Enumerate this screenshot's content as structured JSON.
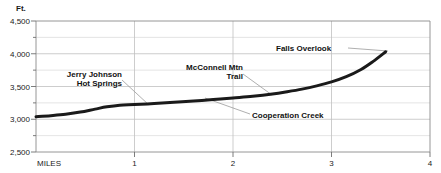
{
  "chart_data": {
    "type": "line",
    "title": "",
    "subtitle": "",
    "xlabel": "MILES",
    "ylabel": "Ft.",
    "xlim": [
      0,
      4
    ],
    "ylim": [
      2500,
      4500
    ],
    "grid": true,
    "legend_position": "none",
    "x_ticks": [
      "1",
      "2",
      "3",
      "4"
    ],
    "x_tick_values": [
      1,
      2,
      3,
      4
    ],
    "x_origin_label": "MILES",
    "y_ticks": [
      "2,500",
      "3,000",
      "3,500",
      "4,000",
      "4,500"
    ],
    "y_tick_values": [
      2500,
      3000,
      3500,
      4000,
      4500
    ],
    "y_minor_step": 250,
    "series": [
      {
        "name": "Trail elevation profile",
        "x": [
          0.0,
          0.15,
          0.3,
          0.45,
          0.6,
          0.72,
          0.85,
          1.0,
          1.2,
          1.4,
          1.6,
          1.8,
          2.0,
          2.2,
          2.4,
          2.55,
          2.7,
          2.85,
          3.0,
          3.15,
          3.3,
          3.42,
          3.55
        ],
        "y": [
          3040,
          3055,
          3075,
          3110,
          3155,
          3190,
          3215,
          3225,
          3240,
          3258,
          3278,
          3300,
          3325,
          3350,
          3385,
          3420,
          3460,
          3510,
          3570,
          3650,
          3760,
          3880,
          4030
        ]
      }
    ],
    "annotations": [
      {
        "label": "Jerry Johnson\nHot Springs",
        "line1": "Jerry Johnson",
        "line2": "Hot Springs",
        "align": "right",
        "point_miles": 1.15,
        "point_feet": 3235
      },
      {
        "label": "McConnell Mtn\nTrail",
        "line1": "McConnell Mtn",
        "line2": "Trail",
        "align": "right",
        "point_miles": 2.42,
        "point_feet": 3425
      },
      {
        "label": "Cooperation Creek",
        "line1": "Cooperation Creek",
        "line2": "",
        "align": "left",
        "point_miles": 1.72,
        "point_feet": 3292
      },
      {
        "label": "Falls Overlook",
        "line1": "Falls Overlook",
        "line2": "",
        "align": "left",
        "point_miles": 3.55,
        "point_feet": 4030
      }
    ],
    "colors": {
      "curve": "#1a1a1a",
      "grid": "#c8c8c8",
      "axis": "#8a8a8a",
      "leader": "#9a9a9a",
      "text": "#111111",
      "background": "#ffffff"
    }
  }
}
